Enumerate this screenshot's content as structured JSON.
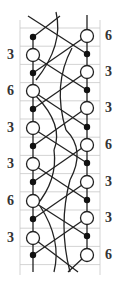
{
  "diagram": {
    "type": "lace-pricking-diagram",
    "colors": {
      "line": "#222222",
      "grid": "#c8c8c8",
      "label": "#333333",
      "background": "#ffffff"
    },
    "left_labels": [
      {
        "text": "3",
        "y": 55
      },
      {
        "text": "6",
        "y": 91
      },
      {
        "text": "3",
        "y": 128
      },
      {
        "text": "3",
        "y": 164
      },
      {
        "text": "6",
        "y": 201
      },
      {
        "text": "3",
        "y": 238
      }
    ],
    "right_labels": [
      {
        "text": "6",
        "y": 36
      },
      {
        "text": "3",
        "y": 72
      },
      {
        "text": "3",
        "y": 108
      },
      {
        "text": "6",
        "y": 145
      },
      {
        "text": "3",
        "y": 182
      },
      {
        "text": "3",
        "y": 218
      },
      {
        "text": "6",
        "y": 255
      }
    ],
    "left_dots_y": [
      37,
      73,
      109,
      146,
      182,
      219,
      255
    ],
    "left_circles_y": [
      55,
      91,
      128,
      164,
      201,
      238
    ],
    "right_dots_y": [
      54,
      90,
      127,
      163,
      200,
      236
    ],
    "right_circles_y": [
      36,
      72,
      108,
      145,
      182,
      218,
      255
    ]
  }
}
